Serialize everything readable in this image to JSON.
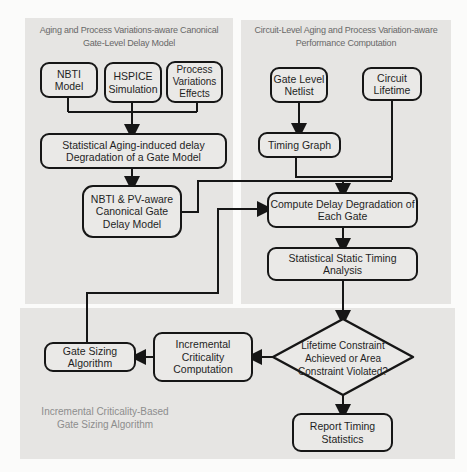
{
  "colors": {
    "page_background": "#fbfbfa",
    "panel_fill": "#e6e5e3",
    "node_fill": "#eae9e7",
    "line_color": "#161616",
    "node_text": "#1f1f1f",
    "panel_title_text": "#686868",
    "caption_text": "#8d8d8d"
  },
  "panels": {
    "gate_delay_model": {
      "title": "Aging and Process Variations-aware Canonical\nGate-Level Delay Model"
    },
    "performance_computation": {
      "title": "Circuit-Level Aging and Process Variation-aware\nPerformance Computation"
    },
    "gate_sizing": {
      "caption": "Incremental Criticality-Based\nGate Sizing Algorithm"
    }
  },
  "nodes": {
    "nbti_model": {
      "label": "NBTI Model"
    },
    "hspice_simulation": {
      "label": "HSPICE\nSimulation"
    },
    "process_variations": {
      "label": "Process\nVariations\nEffects"
    },
    "stat_aging_degradation": {
      "label": "Statistical Aging-induced delay\nDegradation of a Gate Model"
    },
    "nbti_pv_model": {
      "label": "NBTI & PV-aware\nCanonical Gate\nDelay Model"
    },
    "gate_level_netlist": {
      "label": "Gate Level\nNetlist"
    },
    "circuit_lifetime": {
      "label": "Circuit\nLifetime"
    },
    "timing_graph": {
      "label": "Timing Graph"
    },
    "compute_delay_degradation": {
      "label": "Compute Delay Degradation of\nEach Gate"
    },
    "statistical_static_timing": {
      "label": "Statistical Static Timing\nAnalysis"
    },
    "lifetime_decision": {
      "label": "Lifetime Constraint\nAchieved or Area\nConstraint Violated?"
    },
    "incremental_criticality": {
      "label": "Incremental\nCriticality\nComputation"
    },
    "gate_sizing_algorithm": {
      "label": "Gate Sizing\nAlgorithm"
    },
    "report_timing_statistics": {
      "label": "Report Timing\nStatistics"
    }
  }
}
